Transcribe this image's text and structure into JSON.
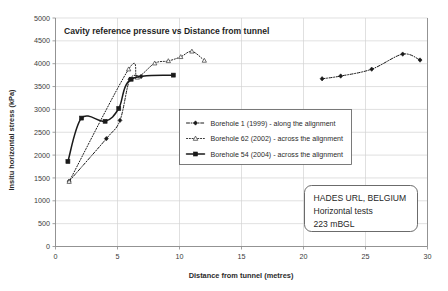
{
  "chart_data": {
    "type": "line",
    "title": "Cavity reference pressure vs Distance from tunnel",
    "xlabel": "Distance from tunnel (metres)",
    "ylabel": "Insitu horizontal stress (kPa)",
    "xlim": [
      0,
      30
    ],
    "ylim": [
      0,
      5000
    ],
    "xticks": [
      0,
      5,
      10,
      15,
      20,
      25,
      30
    ],
    "yticks": [
      0,
      500,
      1000,
      1500,
      2000,
      2500,
      3000,
      3500,
      4000,
      4500,
      5000
    ],
    "xtick_labels": [
      "0",
      "5",
      "10",
      "15",
      "20",
      "25",
      "30"
    ],
    "ytick_labels": [
      "0",
      "500",
      "1000",
      "1500",
      "2000",
      "2500",
      "3000",
      "3500",
      "4000",
      "4500",
      "5000"
    ],
    "grid": true,
    "legend_position": "center",
    "series": [
      {
        "name": "Borehole 1 (1999) - along the alignment",
        "marker": "diamond",
        "line_style": "dash-dot",
        "color": "#1a1a1a",
        "points": [
          {
            "x": 1.1,
            "y": 1430
          },
          {
            "x": 4.1,
            "y": 2360
          },
          {
            "x": 5.2,
            "y": 2760
          },
          {
            "x": 6.0,
            "y": 3660
          },
          {
            "x": 6.9,
            "y": 3720
          },
          {
            "x": 21.5,
            "y": 3670
          },
          {
            "x": 23.0,
            "y": 3730
          },
          {
            "x": 25.5,
            "y": 3880
          },
          {
            "x": 28.0,
            "y": 4210
          },
          {
            "x": 29.4,
            "y": 4080
          }
        ]
      },
      {
        "name": "Borehole 62 (2002) - across the alignment",
        "marker": "triangle",
        "line_style": "dotted",
        "color": "#3a3a3a",
        "points": [
          {
            "x": 1.1,
            "y": 1420
          },
          {
            "x": 5.9,
            "y": 3880
          },
          {
            "x": 6.6,
            "y": 3700
          },
          {
            "x": 8.0,
            "y": 4010
          },
          {
            "x": 9.1,
            "y": 4060
          },
          {
            "x": 10.1,
            "y": 4150
          },
          {
            "x": 11.0,
            "y": 4270
          },
          {
            "x": 12.0,
            "y": 4070
          }
        ]
      },
      {
        "name": "Borehole 54 (2004) - across the alignment",
        "marker": "square",
        "line_style": "solid",
        "color": "#1a1a1a",
        "points": [
          {
            "x": 1.0,
            "y": 1860
          },
          {
            "x": 2.1,
            "y": 2810
          },
          {
            "x": 4.0,
            "y": 2740
          },
          {
            "x": 5.1,
            "y": 3020
          },
          {
            "x": 6.1,
            "y": 3660
          },
          {
            "x": 9.5,
            "y": 3750
          }
        ]
      }
    ],
    "annotations": [
      {
        "name": "site-note",
        "lines": [
          "HADES URL, BELGIUM",
          "Horizontal tests",
          "223 mBGL"
        ]
      }
    ]
  }
}
